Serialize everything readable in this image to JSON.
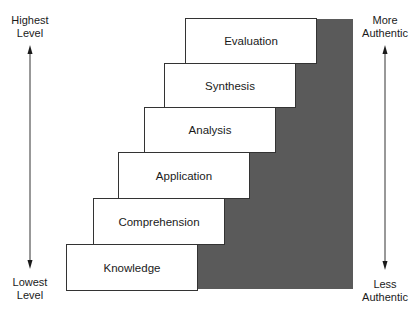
{
  "diagram": {
    "type": "staircase",
    "levels": [
      {
        "label": "Knowledge",
        "rank": 1
      },
      {
        "label": "Comprehension",
        "rank": 2
      },
      {
        "label": "Application",
        "rank": 3
      },
      {
        "label": "Analysis",
        "rank": 4
      },
      {
        "label": "Synthesis",
        "rank": 5
      },
      {
        "label": "Evaluation",
        "rank": 6
      }
    ],
    "left_axis": {
      "top": "Highest\nLevel",
      "top_line1": "Highest",
      "top_line2": "Level",
      "bottom_line1": "Lowest",
      "bottom_line2": "Level"
    },
    "right_axis": {
      "top_line1": "More",
      "top_line2": "Authentic",
      "bottom_line1": "Less",
      "bottom_line2": "Authentic"
    },
    "colors": {
      "shade": "#5a5a5a",
      "box_border": "#333333"
    }
  }
}
